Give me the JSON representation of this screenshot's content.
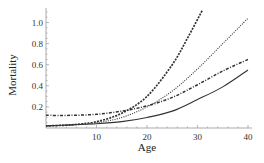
{
  "chart_data": {
    "type": "line",
    "title": "",
    "xlabel": "Age",
    "ylabel": "Mortality",
    "xlim": [
      0,
      40
    ],
    "ylim": [
      0,
      1.1
    ],
    "grid": false,
    "legend": null,
    "x_ticks": [
      10,
      20,
      30,
      40
    ],
    "y_ticks": [
      0.2,
      0.4,
      0.6,
      0.8,
      1.0
    ],
    "x_tick_labels": [
      "10",
      "20",
      "30",
      "40"
    ],
    "y_tick_labels": [
      "0.2",
      "0.4",
      "0.6",
      "0.8",
      "1.0"
    ],
    "series": [
      {
        "name": "solid",
        "style": "solid",
        "color": "#333333",
        "x": [
          0,
          5,
          10,
          15,
          20,
          25,
          30,
          35,
          40
        ],
        "values": [
          0.02,
          0.03,
          0.04,
          0.06,
          0.1,
          0.16,
          0.27,
          0.39,
          0.55
        ]
      },
      {
        "name": "dash-dot",
        "style": "dashdot",
        "color": "#333333",
        "x": [
          0,
          5,
          10,
          15,
          20,
          25,
          30,
          35,
          40
        ],
        "values": [
          0.12,
          0.12,
          0.13,
          0.16,
          0.21,
          0.29,
          0.41,
          0.54,
          0.65
        ]
      },
      {
        "name": "dotted",
        "style": "dotted",
        "color": "#333333",
        "x": [
          0,
          5,
          10,
          15,
          20,
          25,
          30,
          35,
          40
        ],
        "values": [
          0.02,
          0.03,
          0.05,
          0.1,
          0.2,
          0.35,
          0.56,
          0.8,
          1.04
        ]
      },
      {
        "name": "dashed",
        "style": "dashed",
        "color": "#333333",
        "x": [
          0,
          5,
          10,
          15,
          20,
          25,
          28,
          31
        ],
        "values": [
          0.02,
          0.03,
          0.06,
          0.14,
          0.3,
          0.6,
          0.85,
          1.12
        ]
      }
    ]
  }
}
